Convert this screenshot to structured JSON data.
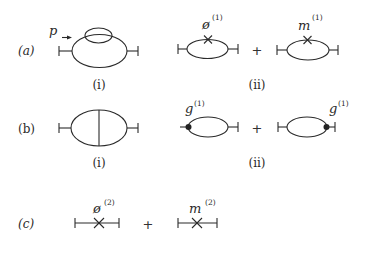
{
  "figure": {
    "rows": [
      {
        "label": "(a)",
        "momentum_label": "p",
        "sub_i": "(i)",
        "sub_ii": "(ii)",
        "term1_symbol": "ø",
        "term1_order": "(1)",
        "term2_symbol": "m",
        "term2_order": "(1)",
        "plus": "+"
      },
      {
        "label": "(b)",
        "sub_i": "(i)",
        "sub_ii": "(ii)",
        "term1_symbol": "g",
        "term1_order": "(1)",
        "term2_symbol": "g",
        "term2_order": "(1)",
        "plus": "+"
      },
      {
        "label": "(c)",
        "term1_symbol": "ø",
        "term1_order": "(2)",
        "term2_symbol": "m",
        "term2_order": "(2)",
        "plus": "+"
      }
    ],
    "colors": {
      "ink": "#2a2a2a",
      "background": "#ffffff"
    }
  }
}
